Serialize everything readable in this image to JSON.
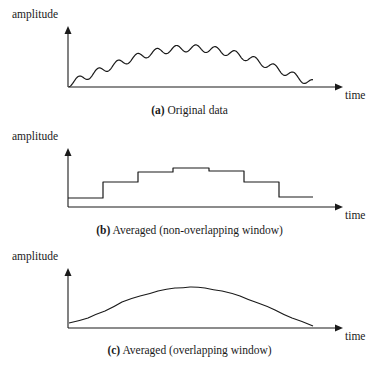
{
  "panels": [
    {
      "id": "a",
      "ylabel": "amplitude",
      "xlabel": "time",
      "caption_tag": "(a)",
      "caption_text": " Original data",
      "type": "wavy",
      "axis": {
        "x0": 68,
        "y0": 87,
        "xEnd": 343,
        "yTop": 26
      },
      "curve": {
        "x_start": 69,
        "x_end": 313,
        "cycles": 12.5,
        "ripple_amp": 3.5,
        "base_start": 84,
        "peak": 49,
        "base_end": 84
      }
    },
    {
      "id": "b",
      "ylabel": "amplitude",
      "xlabel": "time",
      "caption_tag": "(b)",
      "caption_text": " Averaged (non-overlapping window)",
      "type": "step",
      "axis": {
        "x0": 68,
        "y0": 207,
        "xEnd": 343,
        "yTop": 148
      },
      "steps": [
        {
          "x1": 68,
          "x2": 103,
          "y": 198
        },
        {
          "x1": 103,
          "x2": 138,
          "y": 182
        },
        {
          "x1": 138,
          "x2": 173,
          "y": 172
        },
        {
          "x1": 173,
          "x2": 209,
          "y": 168
        },
        {
          "x1": 209,
          "x2": 244,
          "y": 171
        },
        {
          "x1": 244,
          "x2": 279,
          "y": 182
        },
        {
          "x1": 279,
          "x2": 313,
          "y": 197
        }
      ]
    },
    {
      "id": "c",
      "ylabel": "amplitude",
      "xlabel": "time",
      "caption_tag": "(c)",
      "caption_text": " Averaged (overlapping window)",
      "type": "smooth",
      "axis": {
        "x0": 68,
        "y0": 328,
        "xEnd": 343,
        "yTop": 268
      },
      "points": [
        [
          69,
          323
        ],
        [
          88,
          318
        ],
        [
          105,
          311
        ],
        [
          122,
          302
        ],
        [
          140,
          296
        ],
        [
          158,
          291
        ],
        [
          175,
          288
        ],
        [
          190,
          287
        ],
        [
          205,
          288
        ],
        [
          222,
          291
        ],
        [
          240,
          296
        ],
        [
          258,
          303
        ],
        [
          275,
          310
        ],
        [
          292,
          318
        ],
        [
          313,
          326
        ]
      ]
    }
  ],
  "chart_data": [
    {
      "type": "line",
      "title": "(a) Original data",
      "xlabel": "time",
      "ylabel": "amplitude",
      "description": "Noisy signal: broad hump with high-frequency ripple (~12 oscillations)",
      "grid": false
    },
    {
      "type": "line",
      "title": "(b) Averaged (non-overlapping window)",
      "xlabel": "time",
      "ylabel": "amplitude",
      "description": "Step function from averaging non-overlapping windows",
      "categories": [
        "w1",
        "w2",
        "w3",
        "w4",
        "w5",
        "w6",
        "w7"
      ],
      "values": [
        1,
        2.6,
        3.6,
        4.0,
        3.7,
        2.6,
        1.1
      ],
      "grid": false
    },
    {
      "type": "line",
      "title": "(c) Averaged (overlapping window)",
      "xlabel": "time",
      "ylabel": "amplitude",
      "description": "Smooth hump from moving-average with overlapping window",
      "grid": false
    }
  ]
}
